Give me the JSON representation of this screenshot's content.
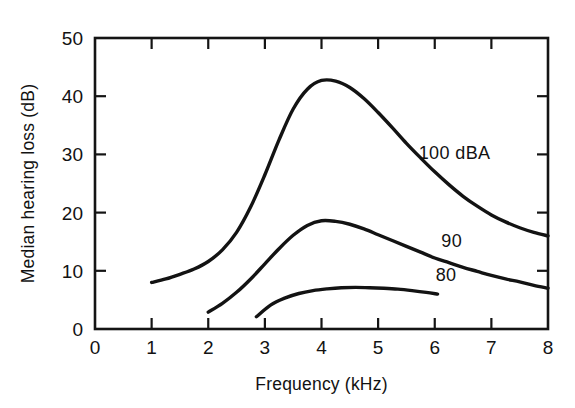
{
  "chart_data": {
    "type": "line",
    "title": "",
    "xlabel": "Frequency (kHz)",
    "ylabel": "Median hearing loss (dB)",
    "xlim": [
      0,
      8
    ],
    "ylim": [
      0,
      50
    ],
    "xticks": [
      0,
      1,
      2,
      3,
      4,
      5,
      6,
      7,
      8
    ],
    "xtick_labels": [
      "0",
      "1",
      "2",
      "3",
      "4",
      "5",
      "6",
      "7",
      "8"
    ],
    "yticks": [
      0,
      10,
      20,
      30,
      40,
      50
    ],
    "ytick_labels": [
      "0",
      "10",
      "20",
      "30",
      "40",
      "50"
    ],
    "grid": false,
    "legend_position": "inline-right-of-curves",
    "line_color": "#131313",
    "series": [
      {
        "name": "100 dBA",
        "label": "100 dBA",
        "label_x": 6.35,
        "label_y": 30.2,
        "x": [
          1.0,
          1.25,
          1.5,
          1.75,
          2.0,
          2.25,
          2.5,
          2.75,
          3.0,
          3.25,
          3.5,
          3.75,
          4.0,
          4.25,
          4.5,
          4.75,
          5.0,
          5.25,
          5.5,
          5.75,
          6.0,
          6.25,
          6.5,
          6.75,
          7.0,
          7.25,
          7.5,
          7.75,
          8.0
        ],
        "y": [
          8.0,
          8.6,
          9.4,
          10.3,
          11.6,
          13.6,
          16.6,
          21.0,
          26.5,
          32.5,
          37.8,
          41.2,
          42.7,
          42.6,
          41.5,
          39.6,
          37.2,
          34.6,
          31.9,
          29.4,
          27.0,
          24.8,
          22.8,
          21.1,
          19.6,
          18.4,
          17.4,
          16.6,
          16.0
        ]
      },
      {
        "name": "90",
        "label": "90",
        "label_x": 6.3,
        "label_y": 15.1,
        "x": [
          2.0,
          2.25,
          2.5,
          2.75,
          3.0,
          3.25,
          3.5,
          3.75,
          4.0,
          4.25,
          4.5,
          4.75,
          5.0,
          5.25,
          5.5,
          5.75,
          6.0,
          6.25,
          6.5,
          6.75,
          7.0,
          7.25,
          7.5,
          7.75,
          8.0
        ],
        "y": [
          2.9,
          4.4,
          6.3,
          8.6,
          11.2,
          13.8,
          16.1,
          17.8,
          18.6,
          18.5,
          18.0,
          17.2,
          16.2,
          15.2,
          14.2,
          13.2,
          12.2,
          11.4,
          10.6,
          9.9,
          9.2,
          8.6,
          8.1,
          7.5,
          7.0
        ]
      },
      {
        "name": "80",
        "label": "80",
        "label_x": 6.2,
        "label_y": 9.2,
        "x": [
          2.85,
          3.1,
          3.35,
          3.6,
          3.85,
          4.1,
          4.35,
          4.6,
          4.85,
          5.1,
          5.35,
          5.6,
          5.85,
          6.05
        ],
        "y": [
          2.1,
          4.1,
          5.3,
          6.1,
          6.6,
          6.9,
          7.1,
          7.15,
          7.1,
          7.0,
          6.85,
          6.6,
          6.3,
          6.0
        ]
      }
    ]
  },
  "figure": {
    "background_color": "#ffffff",
    "frame_color": "#141414"
  }
}
